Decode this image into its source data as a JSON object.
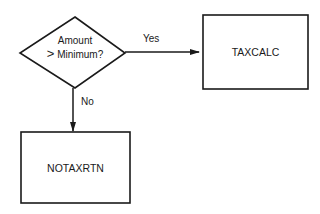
{
  "decision": {
    "line1": "Amount",
    "line2_symbol": ">",
    "line2_text": "Minimum?"
  },
  "process_yes": {
    "label": "TAXCALC"
  },
  "process_no": {
    "label": "NOTAXRTN"
  },
  "edges": {
    "yes_label": "Yes",
    "no_label": "No"
  },
  "colors": {
    "stroke": "#1a1a1a",
    "background": "#ffffff"
  }
}
